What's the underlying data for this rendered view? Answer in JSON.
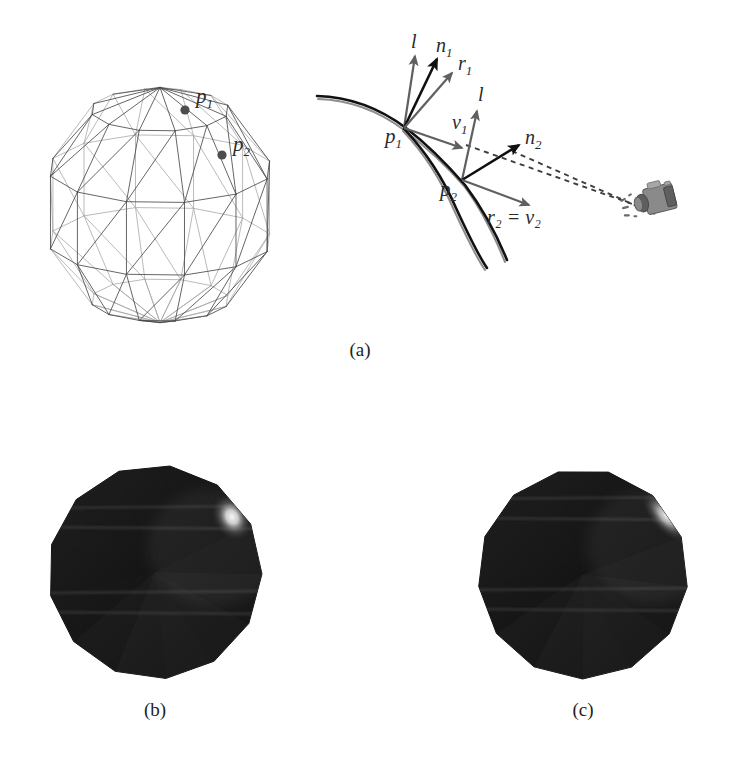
{
  "figure": {
    "background_color": "#ffffff"
  },
  "panels": [
    {
      "id": "a",
      "caption": "(a)",
      "caption_x": 360,
      "caption_y": 356
    },
    {
      "id": "b",
      "caption": "(b)",
      "caption_x": 155,
      "caption_y": 716
    },
    {
      "id": "c",
      "caption": "(c)",
      "caption_x": 583,
      "caption_y": 716
    }
  ],
  "sphere_wireframe": {
    "name": "triangulated-sphere-wireframe",
    "center_x": 160,
    "center_y": 205,
    "radius_x": 118,
    "radius_y": 123,
    "longitude_segments": 12,
    "latitude_bands": 5,
    "stroke_color": "#4a4a4a",
    "points": [
      {
        "label": "p₁",
        "label_text": "p",
        "sub": "1",
        "x": 185,
        "y": 110,
        "label_x": 196,
        "label_y": 103
      },
      {
        "label": "p₂",
        "label_text": "p",
        "sub": "2",
        "x": 222,
        "y": 155,
        "label_x": 233,
        "label_y": 151
      }
    ]
  },
  "diagram_a": {
    "name": "reflection-vector-diagram",
    "surface_points": [
      {
        "id": "p1",
        "text": "p",
        "sub": "1",
        "x": 404,
        "y": 128,
        "label_x": 385,
        "label_y": 143
      },
      {
        "id": "p2",
        "text": "p",
        "sub": "2",
        "x": 462,
        "y": 180,
        "label_x": 440,
        "label_y": 196
      }
    ],
    "vectors": [
      {
        "id": "l1",
        "text": "l",
        "sub": "",
        "from": "p1",
        "x1": 404,
        "y1": 128,
        "x2": 415,
        "y2": 56,
        "style": "gray",
        "label_x": 411,
        "label_y": 48
      },
      {
        "id": "n1",
        "text": "n",
        "sub": "1",
        "from": "p1",
        "x1": 404,
        "y1": 128,
        "x2": 437,
        "y2": 59,
        "style": "dark",
        "label_x": 436,
        "label_y": 52
      },
      {
        "id": "r1",
        "text": "r",
        "sub": "1",
        "from": "p1",
        "x1": 404,
        "y1": 128,
        "x2": 452,
        "y2": 73,
        "style": "gray",
        "label_x": 458,
        "label_y": 70
      },
      {
        "id": "v1",
        "text": "v",
        "sub": "1",
        "from": "p1",
        "x1": 404,
        "y1": 128,
        "x2": 462,
        "y2": 148,
        "style": "gray",
        "label_x": 452,
        "label_y": 129
      },
      {
        "id": "l2",
        "text": "l",
        "sub": "",
        "from": "p2",
        "x1": 462,
        "y1": 180,
        "x2": 477,
        "y2": 111,
        "style": "gray",
        "label_x": 478,
        "label_y": 101
      },
      {
        "id": "n2",
        "text": "n",
        "sub": "2",
        "from": "p2",
        "x1": 462,
        "y1": 180,
        "x2": 519,
        "y2": 145,
        "style": "dark",
        "label_x": 525,
        "label_y": 144
      },
      {
        "id": "r2",
        "text": "r₂ = v₂",
        "sub": "",
        "from": "p2",
        "x1": 462,
        "y1": 180,
        "x2": 529,
        "y2": 205,
        "style": "gray",
        "label_x": 487,
        "label_y": 224
      }
    ],
    "dashed_rays": [
      {
        "id": "ray-n2-camera",
        "x1": 466,
        "y1": 145,
        "x2": 655,
        "y2": 212
      },
      {
        "id": "ray-r2-camera",
        "x1": 512,
        "y1": 151,
        "x2": 655,
        "y2": 214
      }
    ],
    "camera": {
      "name": "camera-icon",
      "x": 655,
      "y": 200,
      "color": "#8a8a8a"
    },
    "curves": {
      "true_surface_color": "#111111",
      "approx_surface_color": "#8d8d8d"
    }
  },
  "rendered_spheres": [
    {
      "id": "b",
      "name": "shaded-sphere-phong-normals",
      "center_x": 155,
      "center_y": 572,
      "radius": 107,
      "sides": 13,
      "rotation_deg": 8,
      "base_color": "#131313",
      "highlight_color": "#ffffff",
      "highlight_x": 232,
      "highlight_y": 517,
      "highlight_rx": 20,
      "highlight_ry": 26,
      "highlight_rot": -30,
      "seam_rows": [
        508,
        527,
        593,
        612
      ]
    },
    {
      "id": "c",
      "name": "shaded-sphere-interpolated-reflection",
      "center_x": 583,
      "center_y": 574,
      "radius": 105,
      "sides": 13,
      "rotation_deg": 14,
      "base_color": "#131313",
      "highlight_color": "#ffffff",
      "highlight_x": 666,
      "highlight_y": 516,
      "highlight_rx": 16,
      "highlight_ry": 34,
      "highlight_rot": -42,
      "seam_rows": [
        499,
        518,
        590,
        609
      ]
    }
  ]
}
